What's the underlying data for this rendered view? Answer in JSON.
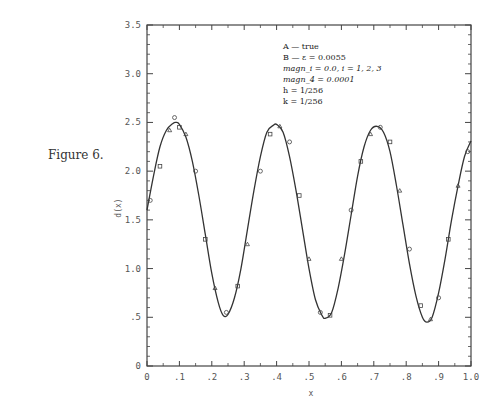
{
  "figure_label": "Figure 6.",
  "chart_data": {
    "type": "line",
    "title": "",
    "xlabel": "x",
    "ylabel": "d(x)",
    "xlim": [
      0,
      1.0
    ],
    "ylim": [
      0,
      3.5
    ],
    "x_ticks": [
      "0",
      ".1",
      ".2",
      ".3",
      ".4",
      ".5",
      ".6",
      ".7",
      ".8",
      ".9",
      "1.0"
    ],
    "y_ticks": [
      "0",
      ".5",
      "1.0",
      "1.5",
      "2.0",
      "2.5",
      "3.0",
      "3.5"
    ],
    "grid": false,
    "legend_position": "upper-right-inside",
    "annotations": [
      "A — true",
      "B — ε = 0.0055",
      "magn_i = 0.0,   i = 1, 2, 3",
      "magn_4 = 0.0001",
      "h = 1/256",
      "k = 1/256"
    ],
    "series": [
      {
        "name": "A — true",
        "style": "solid",
        "x": [
          0.0,
          0.02,
          0.04,
          0.06,
          0.08,
          0.09,
          0.1,
          0.12,
          0.14,
          0.16,
          0.18,
          0.2,
          0.22,
          0.235,
          0.25,
          0.27,
          0.29,
          0.31,
          0.33,
          0.35,
          0.37,
          0.39,
          0.4,
          0.42,
          0.44,
          0.46,
          0.48,
          0.5,
          0.52,
          0.54,
          0.55,
          0.57,
          0.59,
          0.61,
          0.63,
          0.65,
          0.67,
          0.69,
          0.71,
          0.73,
          0.75,
          0.77,
          0.79,
          0.81,
          0.83,
          0.85,
          0.864,
          0.88,
          0.9,
          0.92,
          0.94,
          0.96,
          0.98,
          1.0
        ],
        "y": [
          1.6,
          1.95,
          2.25,
          2.42,
          2.49,
          2.5,
          2.48,
          2.35,
          2.1,
          1.75,
          1.35,
          0.95,
          0.65,
          0.52,
          0.53,
          0.7,
          1.0,
          1.4,
          1.8,
          2.15,
          2.4,
          2.47,
          2.48,
          2.4,
          2.15,
          1.8,
          1.4,
          1.0,
          0.68,
          0.52,
          0.49,
          0.55,
          0.8,
          1.15,
          1.55,
          1.95,
          2.25,
          2.42,
          2.46,
          2.4,
          2.2,
          1.85,
          1.45,
          1.05,
          0.72,
          0.5,
          0.45,
          0.5,
          0.75,
          1.1,
          1.5,
          1.85,
          2.15,
          2.31
        ]
      },
      {
        "name": "B — ε = 0.0055",
        "style": "markers",
        "x": [
          0.01,
          0.04,
          0.07,
          0.085,
          0.1,
          0.12,
          0.15,
          0.18,
          0.21,
          0.245,
          0.28,
          0.31,
          0.35,
          0.38,
          0.41,
          0.44,
          0.47,
          0.5,
          0.535,
          0.565,
          0.6,
          0.63,
          0.66,
          0.69,
          0.72,
          0.75,
          0.78,
          0.81,
          0.845,
          0.875,
          0.9,
          0.93,
          0.96,
          0.99
        ],
        "y": [
          1.7,
          2.05,
          2.42,
          2.55,
          2.45,
          2.38,
          2.0,
          1.3,
          0.8,
          0.55,
          0.82,
          1.25,
          2.0,
          2.38,
          2.46,
          2.3,
          1.75,
          1.1,
          0.55,
          0.52,
          1.1,
          1.6,
          2.1,
          2.38,
          2.45,
          2.3,
          1.8,
          1.2,
          0.62,
          0.48,
          0.7,
          1.3,
          1.85,
          2.2
        ]
      }
    ]
  }
}
